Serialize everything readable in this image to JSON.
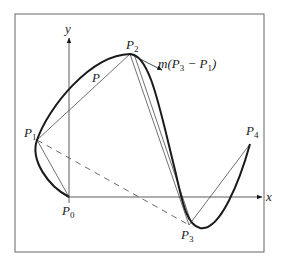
{
  "diagram": {
    "axes": {
      "x_label": "x",
      "y_label": "y"
    },
    "points": [
      {
        "name": "P0",
        "base": "P",
        "sub": "0"
      },
      {
        "name": "P1",
        "base": "P",
        "sub": "1"
      },
      {
        "name": "P2",
        "base": "P",
        "sub": "2"
      },
      {
        "name": "P3",
        "base": "P",
        "sub": "3"
      },
      {
        "name": "P4",
        "base": "P",
        "sub": "4"
      }
    ],
    "curve_label": "P",
    "tangent_label": {
      "prefix": "m(P",
      "sub1": "3",
      "mid": " − P",
      "sub2": "1",
      "suffix": ")"
    },
    "colors": {
      "stroke": "#1a1a1a",
      "frame": "#555555",
      "background": "#ffffff"
    }
  }
}
